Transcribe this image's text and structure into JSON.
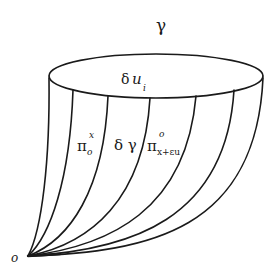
{
  "diagram": {
    "title_symbol": "γ",
    "rim_label": {
      "base": "δ",
      "var": "u",
      "subscript": "i"
    },
    "labels": [
      {
        "id": "pi_o_x",
        "base": "π",
        "subscript": "o",
        "superscript": "x"
      },
      {
        "id": "delta_gamma",
        "text": "δ γ"
      },
      {
        "id": "pi_x_eps_u",
        "base": "π",
        "subscript": "x+εu",
        "superscript": "o"
      }
    ],
    "apex_label": "o",
    "colors": {
      "stroke": "#1a1a1a",
      "background": "#ffffff"
    }
  }
}
